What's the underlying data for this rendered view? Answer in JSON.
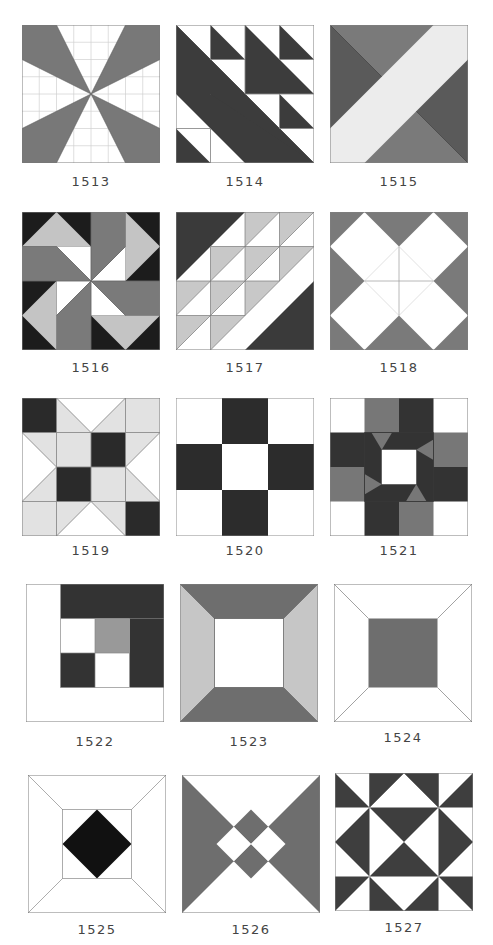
{
  "colors": {
    "white": "#ffffff",
    "light": "#c8c8c8",
    "verylight": "#e4e4e4",
    "mid": "#787878",
    "dark": "#3c3c3c",
    "black": "#1a1a1a",
    "line": "#808080",
    "grid": "#cfcfcf"
  },
  "blocks": [
    {
      "id": "1513",
      "label": "1513",
      "row": 0,
      "col": 0
    },
    {
      "id": "1514",
      "label": "1514",
      "row": 0,
      "col": 1
    },
    {
      "id": "1515",
      "label": "1515",
      "row": 0,
      "col": 2
    },
    {
      "id": "1516",
      "label": "1516",
      "row": 1,
      "col": 0
    },
    {
      "id": "1517",
      "label": "1517",
      "row": 1,
      "col": 1
    },
    {
      "id": "1518",
      "label": "1518",
      "row": 1,
      "col": 2
    },
    {
      "id": "1519",
      "label": "1519",
      "row": 2,
      "col": 0
    },
    {
      "id": "1520",
      "label": "1520",
      "row": 2,
      "col": 1
    },
    {
      "id": "1521",
      "label": "1521",
      "row": 2,
      "col": 2
    },
    {
      "id": "1522",
      "label": "1522",
      "row": 3,
      "col": 0
    },
    {
      "id": "1523",
      "label": "1523",
      "row": 3,
      "col": 1
    },
    {
      "id": "1524",
      "label": "1524",
      "row": 3,
      "col": 2
    },
    {
      "id": "1525",
      "label": "1525",
      "row": 4,
      "col": 0
    },
    {
      "id": "1526",
      "label": "1526",
      "row": 4,
      "col": 1
    },
    {
      "id": "1527",
      "label": "1527",
      "row": 4,
      "col": 2
    }
  ]
}
